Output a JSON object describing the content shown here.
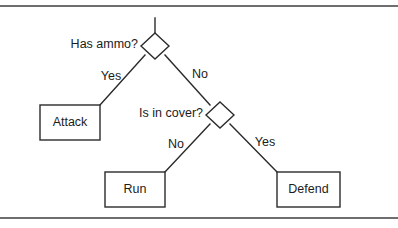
{
  "figure": {
    "type": "decision-tree-flowchart",
    "background_color": "#ffffff",
    "line_color": "#2b2b2b",
    "rule_color": "#6e6e6e",
    "decisions": [
      {
        "id": "has-ammo",
        "label": "Has ammo?",
        "center": {
          "x": 155,
          "y": 46
        },
        "half_width": 14,
        "half_height": 13,
        "label_anchor": {
          "x": 138,
          "y": 45
        }
      },
      {
        "id": "is-in-cover",
        "label": "Is in cover?",
        "center": {
          "x": 220,
          "y": 115
        },
        "half_width": 14,
        "half_height": 13,
        "label_anchor": {
          "x": 203,
          "y": 114
        }
      }
    ],
    "outcomes": [
      {
        "id": "attack",
        "label": "Attack",
        "rect": {
          "x": 40,
          "y": 105,
          "width": 60,
          "height": 35
        }
      },
      {
        "id": "run",
        "label": "Run",
        "rect": {
          "x": 105,
          "y": 172,
          "width": 60,
          "height": 35
        }
      },
      {
        "id": "defend",
        "label": "Defend",
        "rect": {
          "x": 277,
          "y": 172,
          "width": 63,
          "height": 35
        }
      }
    ],
    "edges": [
      {
        "id": "root-stem",
        "label": "",
        "from": {
          "x": 155,
          "y": 18
        },
        "to": {
          "x": 155,
          "y": 33
        }
      },
      {
        "id": "has-ammo-yes",
        "label": "Yes",
        "from": {
          "x": 145,
          "y": 55
        },
        "to": {
          "x": 100,
          "y": 105
        },
        "label_pos": {
          "x": 111,
          "y": 77
        }
      },
      {
        "id": "has-ammo-no",
        "label": "No",
        "from": {
          "x": 165,
          "y": 55
        },
        "to": {
          "x": 210,
          "y": 105
        },
        "label_pos": {
          "x": 200,
          "y": 75
        }
      },
      {
        "id": "is-in-cover-no",
        "label": "No",
        "from": {
          "x": 210,
          "y": 124
        },
        "to": {
          "x": 165,
          "y": 172
        },
        "label_pos": {
          "x": 176,
          "y": 145
        }
      },
      {
        "id": "is-in-cover-yes",
        "label": "Yes",
        "from": {
          "x": 230,
          "y": 124
        },
        "to": {
          "x": 277,
          "y": 172
        },
        "label_pos": {
          "x": 265,
          "y": 143
        }
      }
    ],
    "rules": [
      {
        "id": "top-rule",
        "y": 5
      },
      {
        "id": "bottom-rule",
        "y": 217
      }
    ]
  }
}
